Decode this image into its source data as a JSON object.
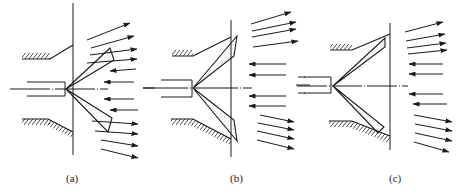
{
  "figure": {
    "panels": [
      {
        "id": "a",
        "label": "(a)"
      },
      {
        "id": "b",
        "label": "(b)"
      },
      {
        "id": "c",
        "label": "(c)"
      }
    ],
    "colors": {
      "line": "#1a1a1a",
      "background": "#ffffff",
      "spray_dots": "#555555"
    }
  }
}
